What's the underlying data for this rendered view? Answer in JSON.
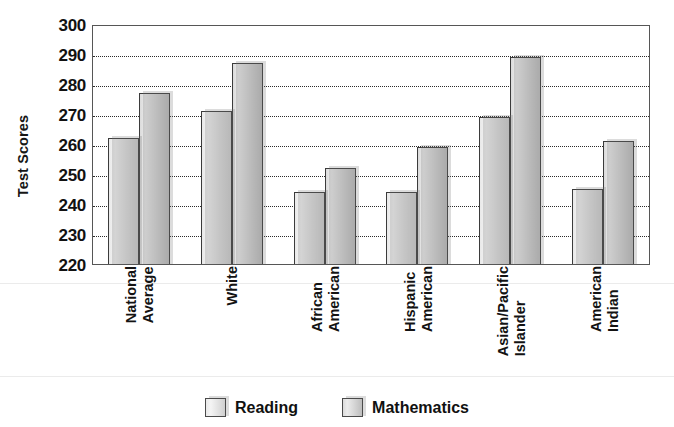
{
  "chart_data": {
    "type": "bar",
    "title": "",
    "xlabel": "",
    "ylabel": "Test Scores",
    "ylim": [
      220,
      300
    ],
    "ytick_step": 10,
    "yticks": [
      300,
      290,
      280,
      270,
      260,
      250,
      240,
      230,
      220
    ],
    "grid": true,
    "grid_style": "dotted-horizontal",
    "legend_position": "bottom-center",
    "categories": [
      "National Average",
      "White",
      "African American",
      "Hispanic American",
      "Asian/Pacific Islander",
      "American Indian"
    ],
    "category_lines": [
      [
        "National",
        "Average"
      ],
      [
        "White",
        ""
      ],
      [
        "African",
        "American"
      ],
      [
        "Hispanic",
        "American"
      ],
      [
        "Asian/Pacific",
        "Islander"
      ],
      [
        "American",
        "Indian"
      ]
    ],
    "series": [
      {
        "name": "Reading",
        "color": "#e4e4e4",
        "values": [
          262,
          271,
          244,
          244,
          269,
          245
        ]
      },
      {
        "name": "Mathematics",
        "color": "#d2d2d2",
        "values": [
          277,
          287,
          252,
          259,
          289,
          261
        ]
      }
    ]
  },
  "legend": {
    "items": [
      {
        "label": "Reading",
        "swatch": "reading"
      },
      {
        "label": "Mathematics",
        "swatch": "math"
      }
    ]
  },
  "axis": {
    "y_caption": "Test Scores"
  },
  "colors": {
    "frame": "#565656",
    "gridline": "#2b2b2b",
    "bar_outline": "#3b3b3b",
    "text": "#121212",
    "background": "#ffffff"
  }
}
